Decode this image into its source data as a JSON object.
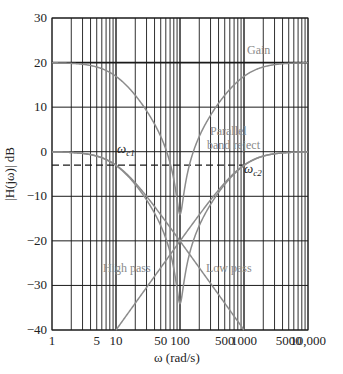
{
  "chart_data": {
    "type": "line",
    "title": "",
    "xlabel": "ω (rad/s)",
    "ylabel": "|H(jω)| dB",
    "xscale": "log",
    "xlim": [
      1,
      10000
    ],
    "ylim": [
      -40,
      30
    ],
    "grid": true,
    "x_ticks": [
      {
        "value": 1,
        "label": "1"
      },
      {
        "value": 5,
        "label": "5"
      },
      {
        "value": 10,
        "label": "10"
      },
      {
        "value": 50,
        "label": "50"
      },
      {
        "value": 100,
        "label": "100"
      },
      {
        "value": 500,
        "label": "500"
      },
      {
        "value": 1000,
        "label": "1000"
      },
      {
        "value": 5000,
        "label": "5000"
      },
      {
        "value": 10000,
        "label": "10,000"
      }
    ],
    "y_ticks": [
      30,
      20,
      10,
      0,
      -10,
      -20,
      -30,
      -40
    ],
    "y_tick_labels": [
      "30",
      "20",
      "10",
      "0",
      "−10",
      "−20",
      "−30",
      "−40"
    ],
    "cutoffs": {
      "wc1": 10,
      "wc2": 1000
    },
    "reference_line": {
      "value_db": -3,
      "style": "dashed",
      "x_end": 1000
    },
    "series": [
      {
        "name": "Low pass",
        "formula": "-10*log10(1+(w/wc1)^2)",
        "points": [
          [
            1,
            0
          ],
          [
            10,
            -3
          ],
          [
            100,
            -20
          ],
          [
            1000,
            -40
          ]
        ]
      },
      {
        "name": "High pass",
        "formula": "-10*log10(1+(wc2/w)^2)",
        "points": [
          [
            10,
            -40
          ],
          [
            100,
            -20
          ],
          [
            1000,
            -3
          ],
          [
            10000,
            0
          ]
        ]
      },
      {
        "name": "Parallel band reject",
        "formula": "20*log10|H_LP + H_HP|",
        "points": [
          [
            1,
            0
          ],
          [
            10,
            -3
          ],
          [
            100,
            -40
          ],
          [
            1000,
            -3
          ],
          [
            10000,
            0
          ]
        ]
      },
      {
        "name": "Gain",
        "formula": "20 + band reject",
        "points": [
          [
            1,
            20
          ],
          [
            10,
            17
          ],
          [
            100,
            -20
          ],
          [
            1000,
            17
          ],
          [
            10000,
            20
          ]
        ]
      }
    ],
    "annotations": [
      {
        "text": "Gain",
        "x": 2500,
        "y": 23
      },
      {
        "text": "Parallel",
        "x": 450,
        "y": 3.5
      },
      {
        "text": "band reject",
        "x": 450,
        "y": -3
      },
      {
        "text": "ωc1",
        "x": 13,
        "y": -1
      },
      {
        "text": "ωc2",
        "x": 1300,
        "y": -5
      },
      {
        "text": "High pass",
        "x": 6,
        "y": -25
      },
      {
        "text": "Low pass",
        "x": 400,
        "y": -25
      }
    ]
  },
  "labels": {
    "gain": "Gain",
    "parallel": "Parallel",
    "band_reject": "band reject",
    "high_pass": "High pass",
    "low_pass": "Low pass",
    "wc1_main": "ω",
    "wc1_sub": "c1",
    "wc2_main": "ω",
    "wc2_sub": "c2",
    "xlabel": "ω (rad/s)",
    "ylabel": "|H(jω)| dB"
  },
  "colors": {
    "grid": "#1a1a1a",
    "curve": "#8c8c8c",
    "label": "#8a8a8a",
    "text": "#222222"
  }
}
